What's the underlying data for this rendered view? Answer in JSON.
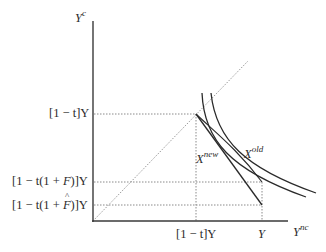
{
  "diagram": {
    "axes": {
      "y_label_base": "Y",
      "y_label_sup": "c",
      "x_label_base": "Y",
      "x_label_sup": "nc"
    },
    "y_ticks": [
      {
        "id": "top",
        "text": "[1 − t]Y",
        "y": 114
      },
      {
        "id": "mid",
        "prefix": "[1 − t(1 + ",
        "var": "F",
        "suffix": ")]Y",
        "y": 182
      },
      {
        "id": "low",
        "prefix": "[1 − t(1 + ",
        "var": "F",
        "hat": true,
        "suffix": ")]Y",
        "y": 205
      }
    ],
    "x_ticks": [
      {
        "id": "kink",
        "text": "[1 − t]Y",
        "x": 196
      },
      {
        "id": "endowment",
        "text": "Y",
        "x": 262
      }
    ],
    "curves": [
      {
        "id": "x-new",
        "label_base": "X",
        "label_sup": "new"
      },
      {
        "id": "x-old",
        "label_base": "X",
        "label_sup": "old"
      }
    ],
    "colors": {
      "axis": "#3a3a3a",
      "curve": "#2a2a2a",
      "dotted": "#8a8a8a",
      "text": "#2b2b2b"
    }
  }
}
